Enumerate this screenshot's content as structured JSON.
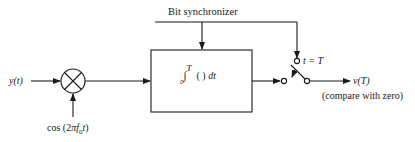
{
  "diagram": {
    "labels": {
      "bit_synchronizer": "Bit synchronizer",
      "input": "y(t)",
      "oscillator": "cos (2πf₀t)",
      "integrator": "₀∫ᵀ ( ) dt",
      "switch_label": "t = T",
      "output": "v(T)",
      "output_note": "(compare with zero)"
    },
    "blocks": [
      {
        "id": "mixer",
        "type": "multiplier",
        "symbol": "⊗"
      },
      {
        "id": "integrator",
        "type": "integrate-and-dump",
        "expression": "integral from 0 to T of ( ) dt"
      },
      {
        "id": "sampler",
        "type": "switch",
        "closes_at": "t = T"
      }
    ],
    "connections": [
      {
        "from": "input y(t)",
        "to": "mixer"
      },
      {
        "from": "cos(2πf0t)",
        "to": "mixer"
      },
      {
        "from": "mixer",
        "to": "integrator"
      },
      {
        "from": "bit synchronizer",
        "to": "integrator"
      },
      {
        "from": "bit synchronizer",
        "to": "sampler"
      },
      {
        "from": "integrator",
        "to": "sampler"
      },
      {
        "from": "sampler",
        "to": "output v(T)"
      }
    ],
    "colors": {
      "stroke": "#1a1a1a",
      "background": "#ffffff"
    }
  }
}
